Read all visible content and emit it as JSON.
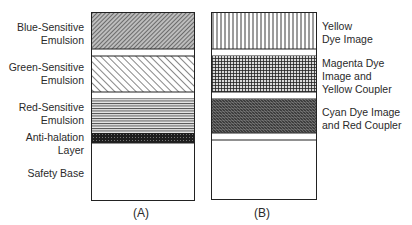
{
  "diagram": {
    "panel_a": {
      "caption": "(A)",
      "labels": [
        {
          "line1": "Blue-Sensitive",
          "line2": "Emulsion"
        },
        {
          "line1": "Green-Sensitive",
          "line2": "Emulsion"
        },
        {
          "line1": "Red-Sensitive",
          "line2": "Emulsion"
        },
        {
          "line1": "Anti-halation",
          "line2": "Layer"
        },
        {
          "line1": "Safety Base",
          "line2": ""
        }
      ]
    },
    "panel_b": {
      "caption": "(B)",
      "labels": [
        {
          "line1": "Yellow",
          "line2": "Dye Image",
          "line3": ""
        },
        {
          "line1": "Magenta Dye",
          "line2": "Image and",
          "line3": "Yellow Coupler"
        },
        {
          "line1": "Cyan Dye Image",
          "line2": "and Red Coupler",
          "line3": ""
        }
      ]
    }
  }
}
